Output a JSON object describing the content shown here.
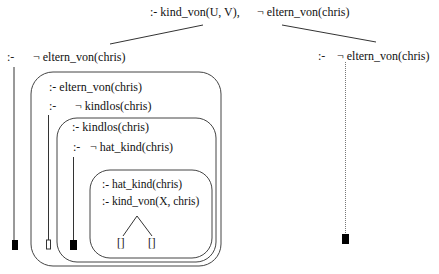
{
  "diagram": {
    "type": "sld-resolution-tree",
    "root": {
      "goal_part1": ":- kind_von(U, V),",
      "goal_part2": "¬ eltern_von(chris)"
    },
    "left_branch": {
      "prefix": ":-",
      "goal": "¬ eltern_von(chris)",
      "leaf": "failure"
    },
    "right_branch": {
      "prefix": ":-",
      "goal": "¬ eltern_von(chris)",
      "leaf": "failure",
      "line_style": "dotted"
    },
    "box1": {
      "query": ":- eltern_von(chris)",
      "prefix": ":-",
      "goal": "¬ kindlos(chris)",
      "leaf": "[]"
    },
    "box2": {
      "query": ":- kindlos(chris)",
      "prefix": ":-",
      "goal": "¬ hat_kind(chris)",
      "leaf": "failure"
    },
    "box3": {
      "query1": ":- hat_kind(chris)",
      "query2": ":- kind_von(X, chris)",
      "leaf_left": "[]",
      "leaf_right": "[]"
    },
    "colors": {
      "stroke": "#444444",
      "text": "#111111",
      "fill_failure": "#000000"
    }
  }
}
